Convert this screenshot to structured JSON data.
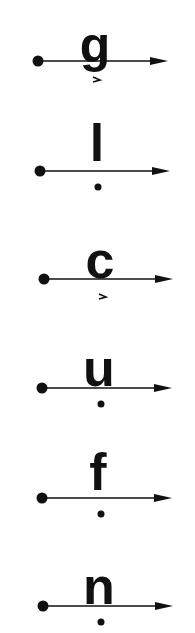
{
  "diagram": {
    "colors": {
      "ink": "#111111",
      "background": "#ffffff"
    },
    "rows": [
      {
        "letter": "g",
        "marker": "chevron",
        "line_y": 61,
        "start_x": 38,
        "end_x": 168,
        "letter_x": 95,
        "mark_x": 97,
        "mark_y": 80
      },
      {
        "letter": "l",
        "marker": "dot",
        "line_y": 171,
        "start_x": 40,
        "end_x": 170,
        "letter_x": 97,
        "mark_x": 98,
        "mark_y": 187
      },
      {
        "letter": "c",
        "marker": "chevron",
        "line_y": 279,
        "start_x": 44,
        "end_x": 173,
        "letter_x": 100,
        "mark_x": 103,
        "mark_y": 297
      },
      {
        "letter": "u",
        "marker": "dot",
        "line_y": 388,
        "start_x": 42,
        "end_x": 172,
        "letter_x": 99,
        "mark_x": 101,
        "mark_y": 404
      },
      {
        "letter": "f",
        "marker": "dot",
        "line_y": 498,
        "start_x": 42,
        "end_x": 172,
        "letter_x": 98,
        "mark_x": 101,
        "mark_y": 514
      },
      {
        "letter": "n",
        "marker": "dot",
        "line_y": 606,
        "start_x": 43,
        "end_x": 173,
        "letter_x": 99,
        "mark_x": 101,
        "mark_y": 622
      }
    ]
  }
}
